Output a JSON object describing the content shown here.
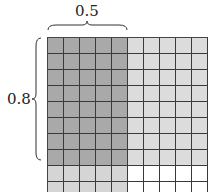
{
  "labels": {
    "horizontal": "0.5",
    "vertical": "0.8"
  },
  "grid": {
    "rows": 10,
    "cols": 10,
    "highlight_cols": 5,
    "highlight_rows": 8
  },
  "colors": {
    "overlap": "#a9a9a9",
    "rows_only": "#dcdcdc",
    "cols_only": "#d5d5d5",
    "none": "#ffffff",
    "line": "#3a3a3a"
  }
}
